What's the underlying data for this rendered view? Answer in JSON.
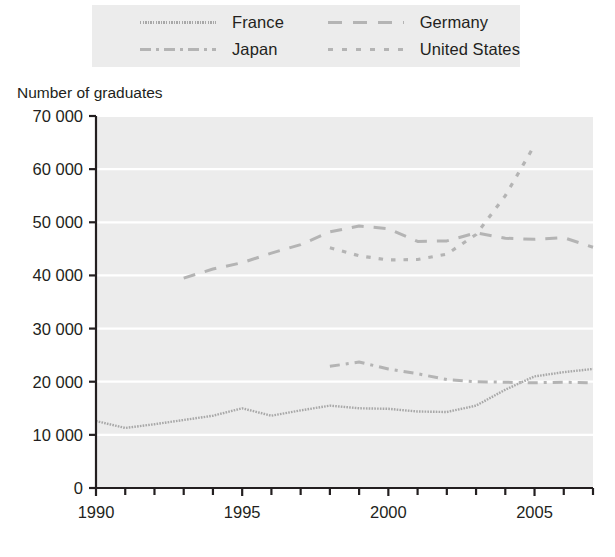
{
  "chart_data": {
    "type": "line",
    "title": "",
    "ylabel": "Number of graduates",
    "xlabel": "",
    "ylim": [
      0,
      70000
    ],
    "xlim": [
      1990,
      2007
    ],
    "grid": true,
    "legend_position": "top",
    "y_ticks": [
      "0",
      "10 000",
      "20 000",
      "30 000",
      "40 000",
      "50 000",
      "60 000",
      "70 000"
    ],
    "y_tick_values": [
      0,
      10000,
      20000,
      30000,
      40000,
      50000,
      60000,
      70000
    ],
    "x_ticks": [
      "1990",
      "1995",
      "2000",
      "2005"
    ],
    "x_tick_values": [
      1990,
      1995,
      2000,
      2005
    ],
    "x_minor_ticks": [
      1991,
      1992,
      1993,
      1994,
      1996,
      1997,
      1998,
      1999,
      2001,
      2002,
      2003,
      2004,
      2006,
      2007
    ],
    "series": [
      {
        "name": "France",
        "style": "solid",
        "color": "#a8a8a8",
        "x": [
          1990,
          1991,
          1992,
          1993,
          1994,
          1995,
          1996,
          1997,
          1998,
          1999,
          2000,
          2001,
          2002,
          2003,
          2004,
          2005,
          2006,
          2007
        ],
        "values": [
          12600,
          11300,
          12000,
          12800,
          13600,
          15000,
          13600,
          14600,
          15500,
          15000,
          14900,
          14400,
          14300,
          15500,
          18500,
          21000,
          21800,
          22400
        ]
      },
      {
        "name": "Germany",
        "style": "longdash",
        "color": "#b4b4b4",
        "x": [
          1993,
          1994,
          1995,
          1996,
          1997,
          1998,
          1999,
          2000,
          2001,
          2002,
          2003,
          2004,
          2005,
          2006,
          2007
        ],
        "values": [
          39500,
          41200,
          42400,
          44200,
          45800,
          48200,
          49300,
          48800,
          46400,
          46500,
          48000,
          47000,
          46800,
          47100,
          45300
        ]
      },
      {
        "name": "Japan",
        "style": "dashdot",
        "color": "#b4b4b4",
        "x": [
          1998,
          1999,
          2000,
          2001,
          2002,
          2003,
          2004,
          2005,
          2006,
          2007
        ],
        "values": [
          22900,
          23700,
          22400,
          21500,
          20400,
          20000,
          19900,
          19800,
          19900,
          19800
        ]
      },
      {
        "name": "United States",
        "style": "shortdash",
        "color": "#b4b4b4",
        "x": [
          1998,
          1999,
          2000,
          2001,
          2002,
          2003,
          2004,
          2005
        ],
        "values": [
          45200,
          43700,
          42900,
          43000,
          44000,
          47700,
          55000,
          64500
        ]
      }
    ]
  },
  "legend": {
    "items": [
      {
        "label": "France",
        "style": "solid",
        "swatch_class": "sw-solid"
      },
      {
        "label": "Germany",
        "style": "longdash",
        "swatch_class": "sw-longdash"
      },
      {
        "label": "Japan",
        "style": "dashdot",
        "swatch_class": "sw-dashdot"
      },
      {
        "label": "United States",
        "style": "shortdash",
        "swatch_class": "sw-shortdash"
      }
    ]
  },
  "colors": {
    "plot_background": "#ececec",
    "gridline": "#ffffff",
    "axis": "#231f20",
    "france_line": "#a8a8a8",
    "other_lines": "#b4b4b4",
    "page_background": "#ffffff"
  }
}
